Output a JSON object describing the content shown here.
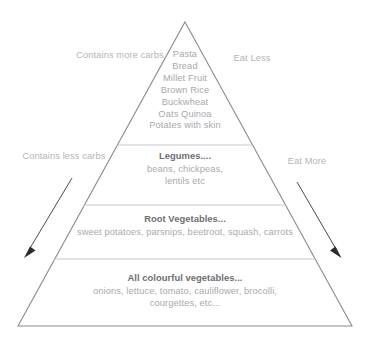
{
  "diagram": {
    "type": "food-pyramid",
    "line_color": "#8c8c90",
    "divider_color": "#c9c9cd",
    "body_text_color": "#a9a9ad",
    "title_text_color": "#6e6e73",
    "arrow_color": "#2b2b2b",
    "background": "#ffffff"
  },
  "side_labels": {
    "top_left": "Contains more carbs",
    "top_right": "Eat Less",
    "bottom_left": "Contains less carbs",
    "bottom_right": "Eat More"
  },
  "tiers": [
    {
      "id": "grains",
      "title": "",
      "items_text": "Pasta\nBread\nMillet Fruit\nBrown Rice\nBuckwheat\nOats Quinoa\nPotates with skin",
      "items": [
        "Pasta",
        "Bread",
        "Millet Fruit",
        "Brown Rice",
        "Buckwheat",
        "Oats Quinoa",
        "Potates with skin"
      ]
    },
    {
      "id": "legumes",
      "title": "Legumes....",
      "items_text": "beans, chickpeas,\nlentils etc",
      "items": [
        "beans, chickpeas,",
        "lentils etc"
      ]
    },
    {
      "id": "root-vegetables",
      "title": "Root Vegetables...",
      "items_text": "sweet potatoes, parsnips, beetroot, squash, carrots",
      "items": [
        "sweet potatoes, parsnips, beetroot, squash, carrots"
      ]
    },
    {
      "id": "colourful-vegetables",
      "title": "All colourful vegetables...",
      "items_text": "onions, lettuce, tomato, cauliflower, brocolli,\ncourgettes, etc...",
      "items": [
        "onions, lettuce, tomato, cauliflower, brocolli,",
        "courgettes, etc..."
      ]
    }
  ]
}
